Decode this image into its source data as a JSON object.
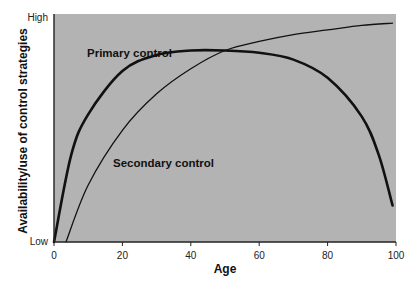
{
  "chart_data": {
    "type": "line",
    "title": "",
    "xlabel": "Age",
    "ylabel": "Availability/use of control strategies",
    "xlim": [
      0,
      100
    ],
    "ylim": [
      "Low",
      "High"
    ],
    "x_ticks": [
      "0",
      "20",
      "40",
      "60",
      "80",
      "100"
    ],
    "y_ticks": [
      "Low",
      "High"
    ],
    "grid": false,
    "legend": "none (inline annotations)",
    "series": [
      {
        "name": "Primary control",
        "x": [
          0,
          5,
          10,
          20,
          30,
          40,
          50,
          60,
          70,
          80,
          90,
          95,
          99
        ],
        "y": [
          0,
          38,
          56,
          75,
          82,
          84,
          84,
          83,
          80,
          72,
          55,
          38,
          16
        ],
        "line_width": "thick"
      },
      {
        "name": "Secondary control",
        "x": [
          3.5,
          10,
          20,
          30,
          40,
          50,
          60,
          70,
          80,
          90,
          99
        ],
        "y": [
          0,
          25,
          49,
          65,
          76,
          84,
          88,
          91,
          93,
          95,
          96
        ],
        "line_width": "thin"
      }
    ],
    "annotations": [
      {
        "text": "Primary control",
        "x": 10,
        "y": 88
      },
      {
        "text": "Secondary control",
        "x": 17,
        "y": 43
      }
    ],
    "y_scale_note": "values 0-100 on qualitative Low-High scale"
  },
  "colors": {
    "plot_background": "#b3b3b3",
    "line": "#111111",
    "axis": "#222222"
  }
}
